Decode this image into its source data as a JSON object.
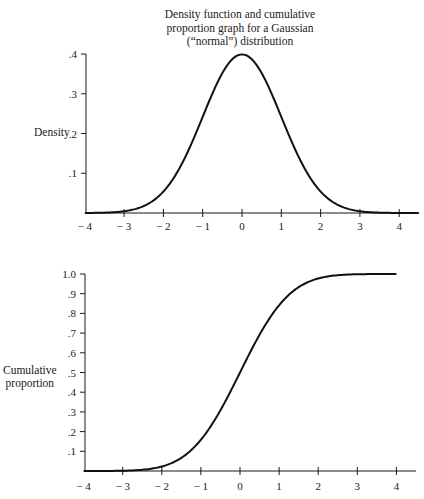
{
  "title_lines": [
    "Density function and cumulative",
    "proportion graph for a Gaussian",
    "(“normal”) distribution"
  ],
  "chart_data": [
    {
      "type": "line",
      "title": "Density function and cumulative proportion graph for a Gaussian (\"normal\") distribution",
      "xlabel": "",
      "ylabel": "Density",
      "xlim": [
        -4,
        4.5
      ],
      "ylim": [
        0,
        0.4
      ],
      "x_ticks": [
        -4,
        -3,
        -2,
        -1,
        0,
        1,
        2,
        3,
        4
      ],
      "x_tick_labels": [
        "− 4",
        "− 3",
        "− 2",
        "− 1",
        "0",
        "1",
        "2",
        "3",
        "4"
      ],
      "y_ticks": [
        0.1,
        0.2,
        0.3,
        0.4
      ],
      "y_tick_labels": [
        ".1",
        ".2",
        ".3",
        ".4"
      ],
      "grid": false,
      "series": [
        {
          "name": "Gaussian density",
          "x": [
            -4,
            -3,
            -2.5,
            -2,
            -1.5,
            -1,
            -0.5,
            0,
            0.5,
            1,
            1.5,
            2,
            2.5,
            3,
            4,
            4.5
          ],
          "y": [
            0.0001,
            0.004,
            0.018,
            0.054,
            0.13,
            0.242,
            0.352,
            0.399,
            0.352,
            0.242,
            0.13,
            0.054,
            0.018,
            0.004,
            0.0001,
            0.0
          ]
        }
      ]
    },
    {
      "type": "line",
      "title": "",
      "xlabel": "",
      "ylabel": "Cumulative proportion",
      "xlim": [
        -4,
        4.5
      ],
      "ylim": [
        0,
        1.0
      ],
      "x_ticks": [
        -4,
        -3,
        -2,
        -1,
        0,
        1,
        2,
        3,
        4
      ],
      "x_tick_labels": [
        "− 4",
        "− 3",
        "− 2",
        "− 1",
        "0",
        "1",
        "2",
        "3",
        "4"
      ],
      "y_ticks": [
        0.1,
        0.2,
        0.3,
        0.4,
        0.5,
        0.6,
        0.7,
        0.8,
        0.9,
        1.0
      ],
      "y_tick_labels": [
        ".1",
        ".2",
        ".3",
        ".4",
        ".5",
        ".6",
        ".7",
        ".8",
        ".9",
        "1.0"
      ],
      "grid": false,
      "series": [
        {
          "name": "Cumulative proportion",
          "x": [
            -4,
            -3,
            -2.5,
            -2,
            -1.5,
            -1,
            -0.5,
            0,
            0.5,
            1,
            1.5,
            2,
            2.5,
            3,
            4
          ],
          "y": [
            0.0,
            0.001,
            0.006,
            0.023,
            0.067,
            0.159,
            0.309,
            0.5,
            0.691,
            0.841,
            0.933,
            0.977,
            0.994,
            0.999,
            1.0
          ]
        }
      ]
    }
  ],
  "labels": {
    "density_ylabel": "Density",
    "cumulative_ylabel_lines": [
      "Cumulative",
      "proportion"
    ]
  }
}
